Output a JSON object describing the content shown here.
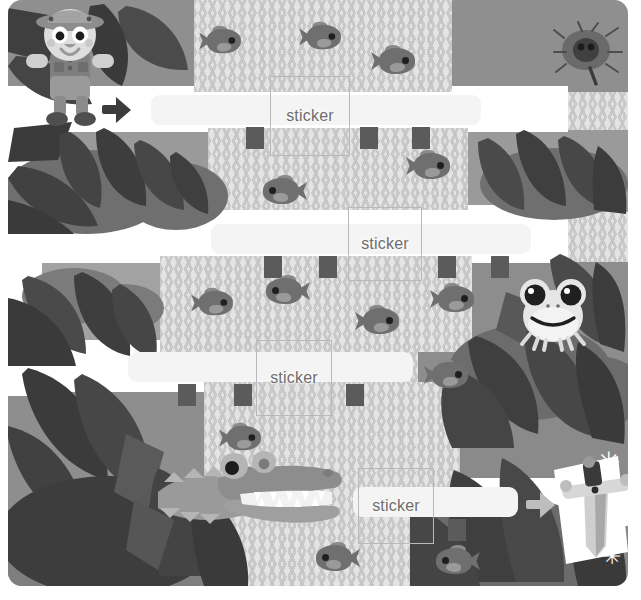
{
  "page": {
    "width": 641,
    "height": 600,
    "background_color": "#ffffff"
  },
  "palette": {
    "paper": "#ffffff",
    "river_light": "#e4e4e4",
    "river_wave": "#c9c9c9",
    "bridge": "#f5f5f5",
    "post_dark": "#5b5b5b",
    "foliage_dark": "#3f3f3f",
    "foliage_mid": "#6a6a6a",
    "foliage_light": "#9c9c9c",
    "ground": "#b4b4b4",
    "fish": "#6f6f6f",
    "sticker_border": "#b9b9b9",
    "sticker_text": "#6d6d6d",
    "arrow_dark": "#3c3c3c",
    "arrow_grey": "#bdbdbd"
  },
  "stickers": [
    {
      "id": "sticker-1",
      "label": "sticker",
      "x": 262,
      "y": 76,
      "w": 78,
      "h": 78
    },
    {
      "id": "sticker-2",
      "label": "sticker",
      "x": 340,
      "y": 207,
      "w": 72,
      "h": 72
    },
    {
      "id": "sticker-3",
      "label": "sticker",
      "x": 248,
      "y": 340,
      "w": 74,
      "h": 74
    },
    {
      "id": "sticker-4",
      "label": "sticker",
      "x": 350,
      "y": 468,
      "w": 74,
      "h": 74
    }
  ],
  "bridges": [
    {
      "id": "bridge-1",
      "x": 143,
      "y": 95,
      "w": 330,
      "h": 30,
      "posts": [
        238,
        352,
        404
      ]
    },
    {
      "id": "bridge-2",
      "x": 203,
      "y": 224,
      "w": 320,
      "h": 30,
      "posts": [
        256,
        311,
        430,
        483
      ]
    },
    {
      "id": "bridge-3",
      "x": 120,
      "y": 352,
      "w": 285,
      "h": 30,
      "posts": [
        170,
        226,
        338
      ]
    },
    {
      "id": "bridge-4",
      "x": 345,
      "y": 487,
      "w": 165,
      "h": 30,
      "posts": [
        440
      ]
    }
  ],
  "markers": [
    {
      "id": "start-arrow",
      "icon": "arrow-right-icon",
      "x": 94,
      "y": 97,
      "style": "dark",
      "meaning": "start"
    },
    {
      "id": "end-arrow",
      "icon": "arrow-right-icon",
      "x": 518,
      "y": 492,
      "style": "grey",
      "meaning": "finish"
    }
  ],
  "characters": [
    {
      "id": "explorer",
      "name": "explorer-boy",
      "x": 16,
      "y": 2,
      "description": "Boy in safari hat and shorts at the start"
    },
    {
      "id": "beetle",
      "name": "beetle-bug",
      "x": 552,
      "y": 26,
      "description": "Dark beetle on a leaf, top right"
    },
    {
      "id": "frog",
      "name": "tree-frog",
      "x": 508,
      "y": 278,
      "description": "Frog peeking from leaves, right side"
    },
    {
      "id": "crocodile",
      "name": "crocodile",
      "x": 160,
      "y": 445,
      "description": "Open-mouthed crocodile in the river, bottom"
    },
    {
      "id": "sword",
      "name": "treasure-sword",
      "x": 560,
      "y": 468,
      "description": "Sparkling sword treasure at the finish"
    }
  ],
  "fish": [
    {
      "x": 190,
      "y": 28,
      "flip": false,
      "scale": 0.95
    },
    {
      "x": 290,
      "y": 24,
      "flip": false,
      "scale": 0.95
    },
    {
      "x": 363,
      "y": 48,
      "flip": false,
      "scale": 1.0
    },
    {
      "x": 398,
      "y": 153,
      "flip": false,
      "scale": 1.0
    },
    {
      "x": 255,
      "y": 178,
      "flip": true,
      "scale": 1.0
    },
    {
      "x": 182,
      "y": 290,
      "flip": false,
      "scale": 0.95
    },
    {
      "x": 258,
      "y": 278,
      "flip": true,
      "scale": 1.0
    },
    {
      "x": 347,
      "y": 308,
      "flip": false,
      "scale": 1.0
    },
    {
      "x": 422,
      "y": 286,
      "flip": false,
      "scale": 1.0
    },
    {
      "x": 416,
      "y": 362,
      "flip": false,
      "scale": 1.0
    },
    {
      "x": 210,
      "y": 425,
      "flip": false,
      "scale": 0.95
    },
    {
      "x": 218,
      "y": 468,
      "flip": true,
      "scale": 0.9
    },
    {
      "x": 308,
      "y": 545,
      "flip": true,
      "scale": 1.0
    },
    {
      "x": 428,
      "y": 548,
      "flip": true,
      "scale": 1.0
    }
  ],
  "sparkles": [
    {
      "x": 589,
      "y": 449,
      "size": 28
    },
    {
      "x": 563,
      "y": 528,
      "size": 24
    },
    {
      "x": 595,
      "y": 546,
      "size": 22
    }
  ]
}
